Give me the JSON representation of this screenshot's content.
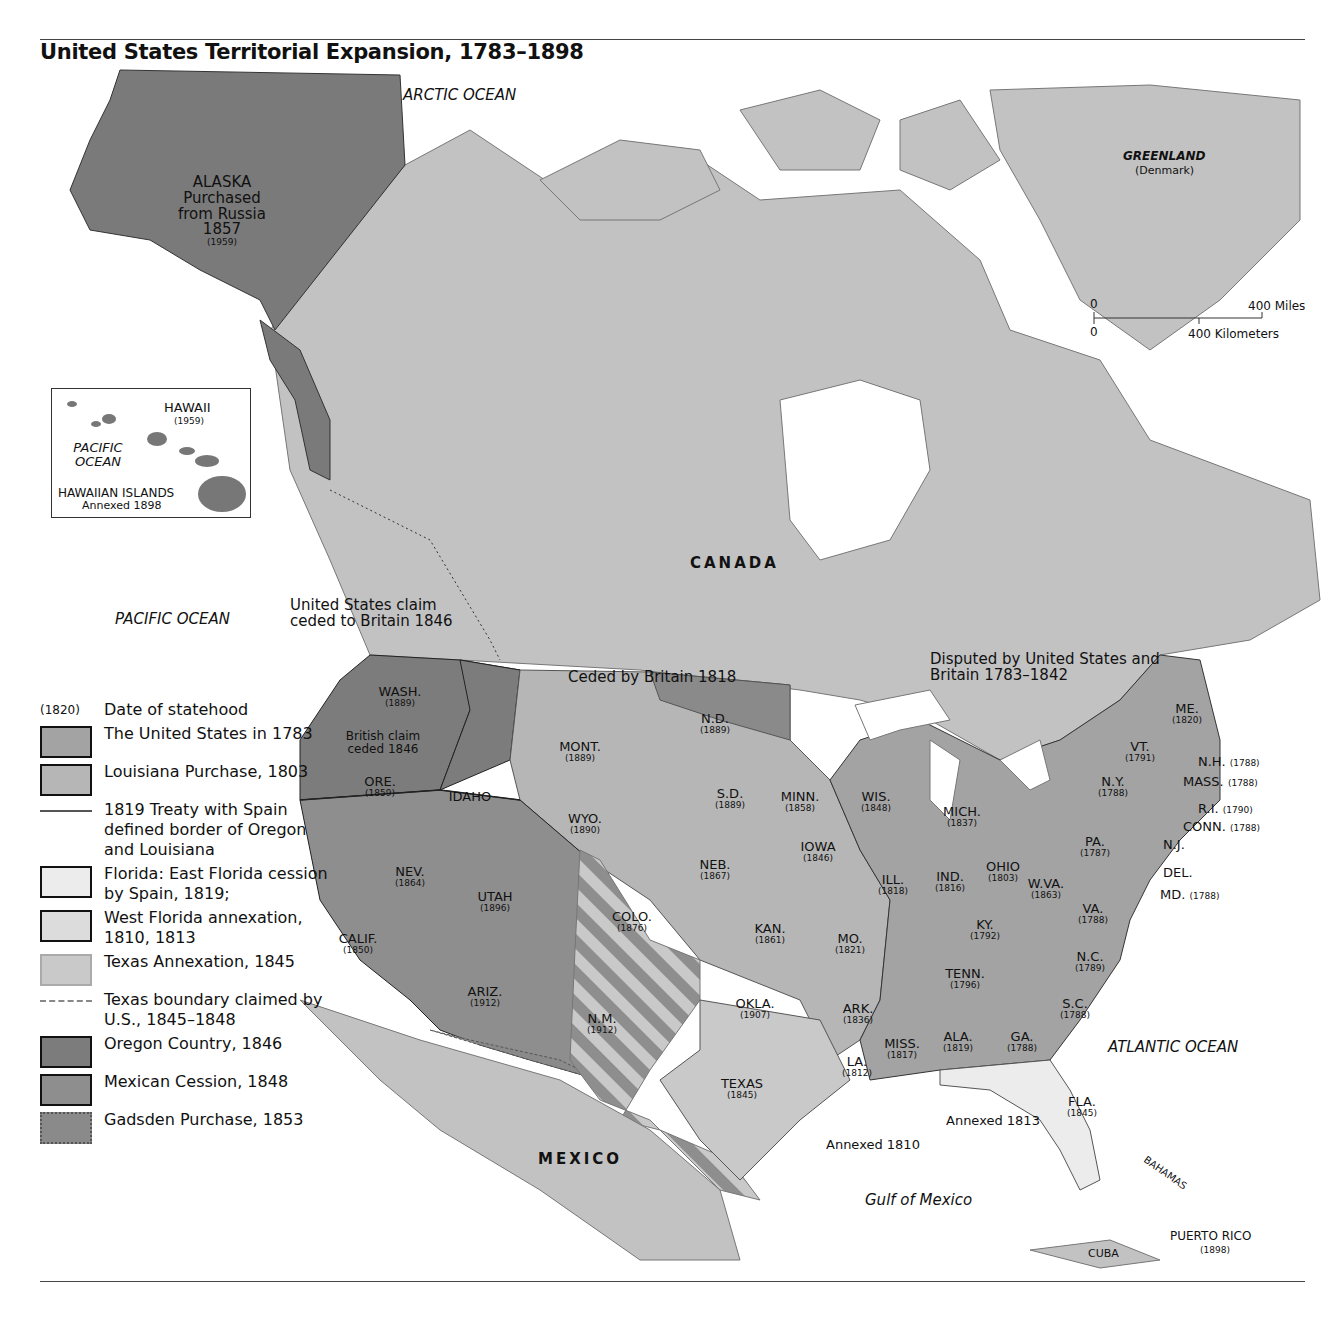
{
  "header": {
    "title": "United States Territorial Expansion, 1783–1898"
  },
  "oceans": {
    "arctic": "ARCTIC OCEAN",
    "pacific": "PACIFIC OCEAN",
    "atlantic": "ATLANTIC OCEAN",
    "gulf": "Gulf of Mexico"
  },
  "countries": {
    "canada": "CANADA",
    "mexico": "MEXICO",
    "greenland": "GREENLAND",
    "greenland_note": "(Denmark)",
    "cuba": "CUBA",
    "bahamas": "BAHAMAS",
    "puerto_rico": "PUERTO RICO",
    "puerto_rico_year": "(1898)"
  },
  "alaska": {
    "lines": [
      "ALASKA",
      "Purchased",
      "from Russia",
      "1857"
    ],
    "statehood": "(1959)"
  },
  "hawaii_inset": {
    "name": "HAWAII",
    "statehood": "(1959)",
    "ocean": "PACIFIC OCEAN",
    "islands": "HAWAIIAN ISLANDS",
    "annexed": "Annexed 1898"
  },
  "scale_bar": {
    "zero_mi": "0",
    "miles": "400 Miles",
    "zero_km": "0",
    "km": "400 Kilometers"
  },
  "annotations": {
    "us_claim": "United States claim ceded to Britain 1846",
    "ceded_britain": "Ceded by Britain 1818",
    "disputed": "Disputed by United States and Britain 1783–1842",
    "british_claim": "British claim ceded 1846",
    "annexed_1810": "Annexed 1810",
    "annexed_1813": "Annexed 1813"
  },
  "states": [
    {
      "name": "WASH.",
      "year": "(1889)",
      "x": 400,
      "y": 685
    },
    {
      "name": "ORE.",
      "year": "(1859)",
      "x": 380,
      "y": 775
    },
    {
      "name": "IDAHO",
      "year": "",
      "x": 470,
      "y": 790
    },
    {
      "name": "MONT.",
      "year": "(1889)",
      "x": 580,
      "y": 740
    },
    {
      "name": "WYO.",
      "year": "(1890)",
      "x": 585,
      "y": 812
    },
    {
      "name": "N.D.",
      "year": "(1889)",
      "x": 715,
      "y": 712
    },
    {
      "name": "S.D.",
      "year": "(1889)",
      "x": 730,
      "y": 787
    },
    {
      "name": "NEB.",
      "year": "(1867)",
      "x": 715,
      "y": 858
    },
    {
      "name": "KAN.",
      "year": "(1861)",
      "x": 770,
      "y": 922
    },
    {
      "name": "OKLA.",
      "year": "(1907)",
      "x": 755,
      "y": 997
    },
    {
      "name": "TEXAS",
      "year": "(1845)",
      "x": 742,
      "y": 1077
    },
    {
      "name": "MINN.",
      "year": "(1858)",
      "x": 800,
      "y": 790
    },
    {
      "name": "IOWA",
      "year": "(1846)",
      "x": 818,
      "y": 840
    },
    {
      "name": "MO.",
      "year": "(1821)",
      "x": 850,
      "y": 932
    },
    {
      "name": "ARK.",
      "year": "(1836)",
      "x": 858,
      "y": 1002
    },
    {
      "name": "LA.",
      "year": "(1812)",
      "x": 857,
      "y": 1055
    },
    {
      "name": "WIS.",
      "year": "(1848)",
      "x": 876,
      "y": 790
    },
    {
      "name": "ILL.",
      "year": "(1818)",
      "x": 893,
      "y": 873
    },
    {
      "name": "MICH.",
      "year": "(1837)",
      "x": 962,
      "y": 805
    },
    {
      "name": "IND.",
      "year": "(1816)",
      "x": 950,
      "y": 870
    },
    {
      "name": "OHIO",
      "year": "(1803)",
      "x": 1003,
      "y": 860
    },
    {
      "name": "KY.",
      "year": "(1792)",
      "x": 985,
      "y": 918
    },
    {
      "name": "TENN.",
      "year": "(1796)",
      "x": 965,
      "y": 967
    },
    {
      "name": "MISS.",
      "year": "(1817)",
      "x": 902,
      "y": 1037
    },
    {
      "name": "ALA.",
      "year": "(1819)",
      "x": 958,
      "y": 1030
    },
    {
      "name": "GA.",
      "year": "(1788)",
      "x": 1022,
      "y": 1030
    },
    {
      "name": "FLA.",
      "year": "(1845)",
      "x": 1082,
      "y": 1095
    },
    {
      "name": "S.C.",
      "year": "(1788)",
      "x": 1075,
      "y": 997
    },
    {
      "name": "N.C.",
      "year": "(1789)",
      "x": 1090,
      "y": 950
    },
    {
      "name": "VA.",
      "year": "(1788)",
      "x": 1093,
      "y": 902
    },
    {
      "name": "W.VA.",
      "year": "(1863)",
      "x": 1046,
      "y": 877
    },
    {
      "name": "PA.",
      "year": "(1787)",
      "x": 1095,
      "y": 835
    },
    {
      "name": "N.Y.",
      "year": "(1788)",
      "x": 1113,
      "y": 775
    },
    {
      "name": "VT.",
      "year": "(1791)",
      "x": 1140,
      "y": 740
    },
    {
      "name": "ME.",
      "year": "(1820)",
      "x": 1187,
      "y": 702
    },
    {
      "name": "NEV.",
      "year": "(1864)",
      "x": 410,
      "y": 865
    },
    {
      "name": "UTAH",
      "year": "(1896)",
      "x": 495,
      "y": 890
    },
    {
      "name": "COLO.",
      "year": "(1876)",
      "x": 632,
      "y": 910
    },
    {
      "name": "CALIF.",
      "year": "(1850)",
      "x": 358,
      "y": 932
    },
    {
      "name": "ARIZ.",
      "year": "(1912)",
      "x": 485,
      "y": 985
    },
    {
      "name": "N.M.",
      "year": "(1912)",
      "x": 602,
      "y": 1012
    }
  ],
  "east_callouts": [
    {
      "name": "N.H.",
      "year": "(1788)",
      "x": 1198,
      "y": 755
    },
    {
      "name": "MASS.",
      "year": "(1788)",
      "x": 1183,
      "y": 775
    },
    {
      "name": "R.I.",
      "year": "(1790)",
      "x": 1198,
      "y": 802
    },
    {
      "name": "CONN.",
      "year": "(1788)",
      "x": 1183,
      "y": 820
    },
    {
      "name": "N.J.",
      "year": "",
      "x": 1163,
      "y": 838
    },
    {
      "name": "DEL.",
      "year": "",
      "x": 1163,
      "y": 866
    },
    {
      "name": "MD.",
      "year": "(1788)",
      "x": 1160,
      "y": 888
    }
  ],
  "legend": {
    "date_sample": "(1820)",
    "date_label": "Date of statehood",
    "items": [
      {
        "type": "box",
        "color": "#a3a3a3",
        "label": "The United States in 1783"
      },
      {
        "type": "box",
        "color": "#b6b6b6",
        "label": "Louisiana Purchase, 1803"
      },
      {
        "type": "line",
        "label": "1819 Treaty with Spain defined border of Oregon and Louisiana"
      },
      {
        "type": "box",
        "color": "#ececec",
        "label": "Florida: East Florida cession by Spain, 1819;"
      },
      {
        "type": "box",
        "color": "#dcdcdc",
        "label": "West Florida annexation, 1810, 1813"
      },
      {
        "type": "box-light",
        "color": "#c9c9c9",
        "label": "Texas Annexation, 1845"
      },
      {
        "type": "dash",
        "label": "Texas boundary claimed by U.S., 1845–1848"
      },
      {
        "type": "box",
        "color": "#7c7c7c",
        "label": "Oregon Country, 1846"
      },
      {
        "type": "box",
        "color": "#8e8e8e",
        "label": "Mexican Cession, 1848"
      },
      {
        "type": "box-dotted",
        "color": "#8a8a8a",
        "label": "Gadsden Purchase, 1853"
      }
    ]
  },
  "colors": {
    "foreign_land": "#c2c2c2",
    "water": "#ffffff",
    "alaska": "#7a7a7a",
    "us1783": "#a3a3a3",
    "louisiana": "#b6b6b6",
    "oregon": "#7c7c7c",
    "mexican_cession": "#8e8e8e",
    "texas": "#c9c9c9",
    "florida": "#ececec"
  }
}
